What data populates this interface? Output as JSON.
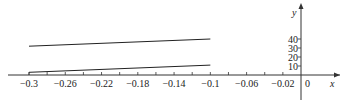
{
  "chart_data": {
    "type": "line",
    "title": "",
    "xlabel": "x",
    "ylabel": "y",
    "xlim": [
      -0.3,
      0
    ],
    "ylim": [
      0,
      40
    ],
    "grid": false,
    "legend": null,
    "x_tick_labels": [
      "-0.3",
      "-0.26",
      "-0.22",
      "-0.18",
      "-0.14",
      "-0.1",
      "-0.06",
      "-0.02",
      "0"
    ],
    "x_ticks": [
      -0.3,
      -0.28,
      -0.26,
      -0.24,
      -0.22,
      -0.2,
      -0.18,
      -0.16,
      -0.14,
      -0.12,
      -0.1,
      -0.08,
      -0.06,
      -0.04,
      -0.02,
      0
    ],
    "y_tick_labels": [
      "10",
      "20",
      "30",
      "40"
    ],
    "y_ticks": [
      10,
      20,
      30,
      40
    ],
    "series": [
      {
        "name": "upper line",
        "x": [
          -0.3,
          -0.1
        ],
        "y": [
          32,
          40
        ],
        "color": "#222222"
      },
      {
        "name": "lower line",
        "x": [
          -0.3,
          -0.1
        ],
        "y": [
          3,
          11
        ],
        "color": "#222222"
      }
    ]
  }
}
